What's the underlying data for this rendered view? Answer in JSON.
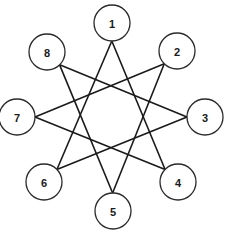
{
  "diagram": {
    "type": "star-polygon",
    "stroke_color": "#1a1a1a",
    "background_color": "#ffffff",
    "node_radius": 18,
    "nodes": [
      {
        "id": 1,
        "label": "1",
        "cx": 112,
        "cy": 23
      },
      {
        "id": 2,
        "label": "2",
        "cx": 177,
        "cy": 51
      },
      {
        "id": 3,
        "label": "3",
        "cx": 205,
        "cy": 117
      },
      {
        "id": 4,
        "label": "4",
        "cx": 178,
        "cy": 182
      },
      {
        "id": 5,
        "label": "5",
        "cx": 113,
        "cy": 211
      },
      {
        "id": 6,
        "label": "6",
        "cx": 44,
        "cy": 182
      },
      {
        "id": 7,
        "label": "7",
        "cx": 17,
        "cy": 117
      },
      {
        "id": 8,
        "label": "8",
        "cx": 47,
        "cy": 52
      }
    ],
    "edges": [
      {
        "from": 1,
        "to": 4
      },
      {
        "from": 4,
        "to": 7
      },
      {
        "from": 7,
        "to": 2
      },
      {
        "from": 2,
        "to": 5
      },
      {
        "from": 5,
        "to": 8
      },
      {
        "from": 8,
        "to": 3
      },
      {
        "from": 3,
        "to": 6
      },
      {
        "from": 6,
        "to": 1
      }
    ]
  }
}
